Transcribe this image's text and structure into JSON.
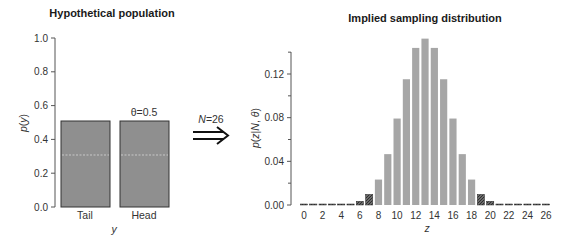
{
  "chart_data": [
    {
      "type": "bar",
      "title": "Hypothetical population",
      "xlabel": "y",
      "ylabel": "p(y)",
      "categories": [
        "Tail",
        "Head"
      ],
      "values": [
        0.5,
        0.5
      ],
      "ylim": [
        0,
        1.0
      ],
      "yticks": [
        "0.0",
        "0.2",
        "0.4",
        "0.6",
        "0.8",
        "1.0"
      ],
      "annotation": "θ=0.5",
      "grid": false
    },
    {
      "type": "bar",
      "title": "Implied sampling distribution",
      "xlabel": "z",
      "ylabel": "p(z|N, θ)",
      "x": [
        0,
        1,
        2,
        3,
        4,
        5,
        6,
        7,
        8,
        9,
        10,
        11,
        12,
        13,
        14,
        15,
        16,
        17,
        18,
        19,
        20,
        21,
        22,
        23,
        24,
        25,
        26
      ],
      "values": [
        0.0,
        0.0,
        0.0,
        0.0,
        0.0002,
        0.0009,
        0.0034,
        0.0097,
        0.0233,
        0.0466,
        0.0792,
        0.1152,
        0.1439,
        0.1524,
        0.1439,
        0.1152,
        0.0792,
        0.0466,
        0.0233,
        0.0097,
        0.0034,
        0.0009,
        0.0002,
        0.0,
        0.0,
        0.0,
        0.0
      ],
      "highlighted_tails": {
        "lower_max_z": 7,
        "upper_min_z": 19
      },
      "xticks": [
        "0",
        "2",
        "4",
        "6",
        "8",
        "10",
        "12",
        "14",
        "16",
        "18",
        "20",
        "22",
        "24",
        "26"
      ],
      "yticks": [
        "0.00",
        "0.04",
        "0.08",
        "0.12"
      ],
      "ylim": [
        0,
        0.14
      ],
      "grid": false
    }
  ],
  "arrow": {
    "label": "N=26"
  },
  "colors": {
    "bar_fill": "#8f8f8f",
    "bar_light": "#a6a6a6",
    "tail_fill": "#4a4a4a",
    "axis": "#555555"
  }
}
